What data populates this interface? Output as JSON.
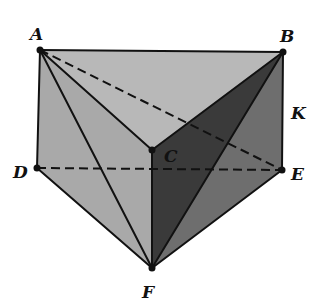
{
  "diagram": {
    "type": "geometric-solid",
    "points": {
      "A": {
        "x": 40,
        "y": 50,
        "label": "A",
        "lx": 30,
        "ly": 40
      },
      "B": {
        "x": 283,
        "y": 52,
        "label": "B",
        "lx": 280,
        "ly": 42
      },
      "C": {
        "x": 152,
        "y": 150,
        "label": "C",
        "lx": 164,
        "ly": 162
      },
      "D": {
        "x": 37,
        "y": 168,
        "label": "D",
        "lx": 13,
        "ly": 178
      },
      "E": {
        "x": 282,
        "y": 170,
        "label": "E",
        "lx": 291,
        "ly": 180
      },
      "F": {
        "x": 152,
        "y": 268,
        "label": "F",
        "lx": 142,
        "ly": 298
      }
    },
    "extra_labels": [
      {
        "text": "K",
        "x": 291,
        "y": 119
      }
    ],
    "faces": [
      {
        "name": "top-face-ABC",
        "points": [
          "A",
          "B",
          "C"
        ],
        "fill": "#b8b8b8"
      },
      {
        "name": "left-face-ACFD",
        "points": [
          "A",
          "C",
          "F",
          "D"
        ],
        "fill": "#a9a9a9"
      },
      {
        "name": "right-face-CBEF",
        "points": [
          "C",
          "B",
          "E",
          "F"
        ],
        "fill": "#6e6e6e"
      },
      {
        "name": "dark-face-CBF",
        "points": [
          "C",
          "B",
          "F"
        ],
        "fill": "#3a3a3a"
      }
    ],
    "solid_edges": [
      [
        "A",
        "B"
      ],
      [
        "A",
        "D"
      ],
      [
        "A",
        "C"
      ],
      [
        "B",
        "C"
      ],
      [
        "B",
        "E"
      ],
      [
        "D",
        "F"
      ],
      [
        "E",
        "F"
      ],
      [
        "C",
        "F"
      ],
      [
        "A",
        "F"
      ],
      [
        "B",
        "F"
      ]
    ],
    "dashed_edges": [
      [
        "A",
        "E"
      ],
      [
        "D",
        "E"
      ]
    ],
    "colors": {
      "stroke": "#111111",
      "point": "#111111"
    }
  }
}
